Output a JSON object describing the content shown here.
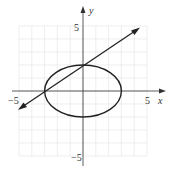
{
  "chart_data": {
    "type": "line",
    "title": "",
    "xlabel": "x",
    "ylabel": "y",
    "xlim": [
      -5,
      5
    ],
    "ylim": [
      -5,
      5
    ],
    "grid": true,
    "tick_labels": {
      "x": [
        "-5",
        "5"
      ],
      "y": [
        "5",
        "-5"
      ]
    },
    "series": [
      {
        "name": "ellipse",
        "equation": "x^2/9 + y^2/4 = 1",
        "center": [
          0,
          0
        ],
        "a": 3,
        "b": 2
      },
      {
        "name": "line",
        "equation": "y = (2/3)x + 2",
        "points": [
          [
            -3,
            0
          ],
          [
            0,
            2
          ]
        ],
        "slope": 0.6667,
        "intercept": 2,
        "arrows": true
      }
    ]
  },
  "labels": {
    "x_axis": "x",
    "y_axis": "y",
    "x_min": "−5",
    "x_max": "5",
    "y_max": "5",
    "y_min": "−5"
  }
}
